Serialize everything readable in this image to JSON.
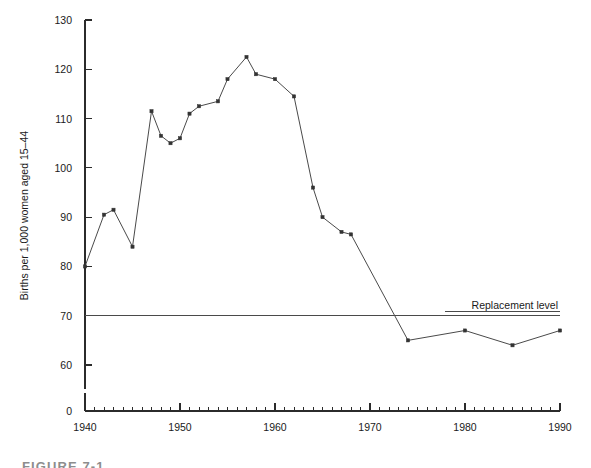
{
  "figure": {
    "caption": "FIGURE 7-1",
    "background_color": "#ffffff",
    "line_color": "#4a4a4a",
    "marker_color": "#333333",
    "axis_color": "#2b2b2b"
  },
  "annotations": {
    "replacement_label": "Replacement level",
    "replacement_value": 70
  },
  "chart_data": {
    "type": "line",
    "title": "",
    "subtitle": "",
    "xlabel": "",
    "ylabel": "Births per 1,000 women aged 15–44",
    "xlim": [
      1940,
      1990
    ],
    "ylim": [
      0,
      130
    ],
    "y_ticks": [
      0,
      60,
      70,
      80,
      90,
      100,
      110,
      120,
      130
    ],
    "y_tick_labels": [
      "0",
      "60",
      "70",
      "80",
      "90",
      "100",
      "110",
      "120",
      "130"
    ],
    "x_ticks": [
      1940,
      1950,
      1960,
      1970,
      1980,
      1990
    ],
    "x_tick_labels": [
      "1940",
      "1950",
      "1960",
      "1970",
      "1980",
      "1990"
    ],
    "x_minor_tick_step": 1,
    "y_axis_break_below": 60,
    "grid": false,
    "legend": false,
    "legend_position": "none",
    "series": [
      {
        "name": "General fertility rate",
        "markers": true,
        "x": [
          1940,
          1942,
          1943,
          1945,
          1947,
          1948,
          1949,
          1950,
          1951,
          1952,
          1954,
          1955,
          1957,
          1958,
          1960,
          1962,
          1964,
          1965,
          1967,
          1968,
          1974,
          1980,
          1985,
          1990
        ],
        "values": [
          80,
          90.5,
          91.5,
          84,
          111.5,
          106.5,
          105,
          106,
          111,
          112.5,
          113.5,
          118,
          122.5,
          119,
          118,
          114.5,
          96,
          90,
          87,
          86.5,
          65,
          67,
          64,
          67
        ]
      }
    ],
    "annotation_lines": [
      {
        "label": "Replacement level",
        "orientation": "horizontal",
        "value": 70
      }
    ]
  }
}
